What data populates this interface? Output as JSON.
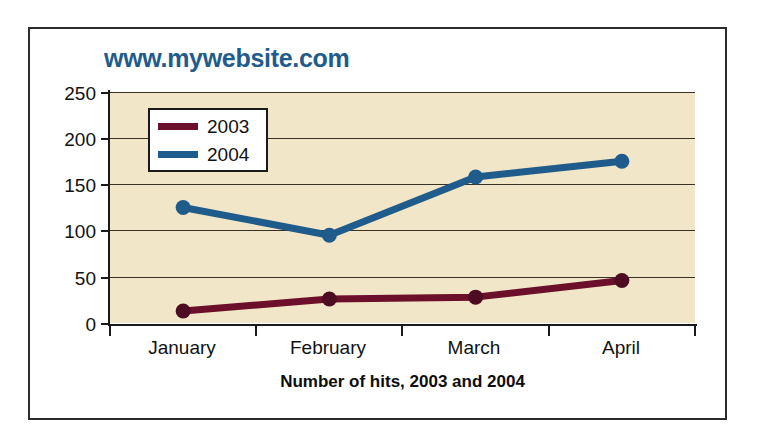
{
  "chart_data": {
    "type": "line",
    "title": "www.mywebsite.com",
    "xlabel": "Number of hits, 2003 and 2004",
    "ylabel": "",
    "categories": [
      "January",
      "February",
      "March",
      "April"
    ],
    "series": [
      {
        "name": "2003",
        "values": [
          13,
          26,
          28,
          46
        ],
        "color": "#6b0f2b"
      },
      {
        "name": "2004",
        "values": [
          125,
          95,
          158,
          175
        ],
        "color": "#1f5c8b"
      }
    ],
    "ylim": [
      0,
      250
    ],
    "yticks": [
      0,
      50,
      100,
      150,
      200,
      250
    ],
    "ytick_labels": [
      "0",
      "50",
      "100",
      "150",
      "200",
      "250"
    ],
    "grid": true,
    "legend_position": "top-left",
    "plot_background": "#f2e6c8",
    "title_color": "#1f5c8b"
  },
  "legend": {
    "entries": [
      {
        "label": "2003"
      },
      {
        "label": "2004"
      }
    ]
  },
  "axis": {
    "y_labels": [
      "250",
      "200",
      "150",
      "100",
      "50",
      "0"
    ],
    "x_labels": [
      "January",
      "February",
      "March",
      "April"
    ],
    "x_title": "Number of hits, 2003 and 2004"
  }
}
